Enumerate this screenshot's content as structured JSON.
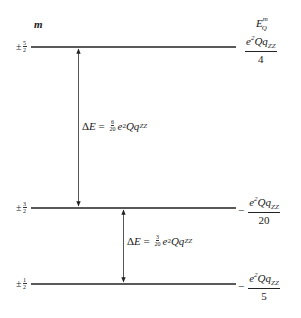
{
  "header": {
    "m_label": "m",
    "energy_label": "E",
    "energy_sup": "m",
    "energy_sub": "Q"
  },
  "levels": [
    {
      "sign": "±",
      "m_num": "5",
      "m_den": "2",
      "energy_sign": "",
      "energy_num_e": "e",
      "energy_num_sup": "2",
      "energy_num_rest": "Qq",
      "energy_num_sub": "ZZ",
      "energy_den": "4"
    },
    {
      "sign": "±",
      "m_num": "3",
      "m_den": "2",
      "energy_sign": "−",
      "energy_num_e": "e",
      "energy_num_sup": "2",
      "energy_num_rest": "Qq",
      "energy_num_sub": "ZZ",
      "energy_den": "20"
    },
    {
      "sign": "±",
      "m_num": "1",
      "m_den": "2",
      "energy_sign": "−",
      "energy_num_e": "e",
      "energy_num_sup": "2",
      "energy_num_rest": "Qq",
      "energy_num_sub": "ZZ",
      "energy_den": "5"
    }
  ],
  "transitions": [
    {
      "from": "±5/2",
      "to": "±3/2",
      "delta": "Δ",
      "E": "E",
      "eq": " = ",
      "coef_num": "6",
      "coef_den": "20",
      "e": "e",
      "sup": "2",
      "rest": "Qq",
      "sub": "ZZ"
    },
    {
      "from": "±3/2",
      "to": "±1/2",
      "delta": "Δ",
      "E": "E",
      "eq": " = ",
      "coef_num": "3",
      "coef_den": "20",
      "e": "e",
      "sup": "2",
      "rest": "Qq",
      "sub": "ZZ"
    }
  ]
}
